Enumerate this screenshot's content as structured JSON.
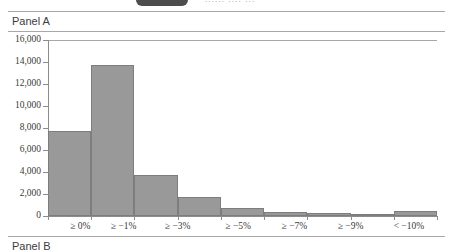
{
  "legend": {
    "swatch_name": "legend-swatch",
    "text": "......  ....  ..."
  },
  "panels": {
    "a_label": "Panel A",
    "b_label": "Panel B"
  },
  "chart_data": {
    "type": "bar",
    "title": "Panel A",
    "xlabel": "",
    "ylabel": "",
    "categories": [
      "≥ 0%",
      "≥ −1%",
      "≥ −3%",
      "≥ −5%",
      "≥ −7%",
      "≥ −9%",
      "< −10%"
    ],
    "bar_values": [
      7750,
      13700,
      3700,
      1700,
      700,
      400,
      250,
      150,
      450
    ],
    "ylim": [
      0,
      16000
    ],
    "ytick_values": [
      0,
      2000,
      4000,
      6000,
      8000,
      10000,
      12000,
      14000,
      16000
    ],
    "ytick_labels": [
      "0",
      "2,000",
      "4,000",
      "6,000",
      "8,000",
      "10,000",
      "12,000",
      "14,000",
      "16,000"
    ],
    "grid": false,
    "legend_position": "top",
    "bar_color": "#999999",
    "bar_edge_color": "#7d7d7d",
    "axis_color": "#8c8c8c"
  }
}
